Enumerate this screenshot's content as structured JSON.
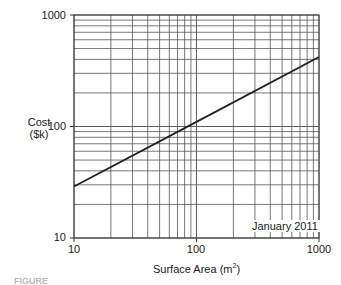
{
  "chart_data": {
    "type": "line",
    "title": "",
    "xlabel": "Surface Area (m²)",
    "xlabel_base": "Surface Area (m",
    "xlabel_sup": "2",
    "xlabel_end": ")",
    "ylabel_line1": "Cost",
    "ylabel_line2": "($k)",
    "ylabel": "Cost ($k)",
    "x_scale": "log",
    "y_scale": "log",
    "xlim": [
      10,
      1000
    ],
    "ylim": [
      10,
      1000
    ],
    "x_ticks": [
      "10",
      "100",
      "1000"
    ],
    "y_ticks": [
      "10",
      "100",
      "1000"
    ],
    "grid": true,
    "annotation": "January 2011",
    "series": [
      {
        "name": "Cost",
        "x": [
          10,
          100,
          1000
        ],
        "y": [
          29,
          110,
          420
        ]
      }
    ]
  },
  "caption": "FIGURE"
}
